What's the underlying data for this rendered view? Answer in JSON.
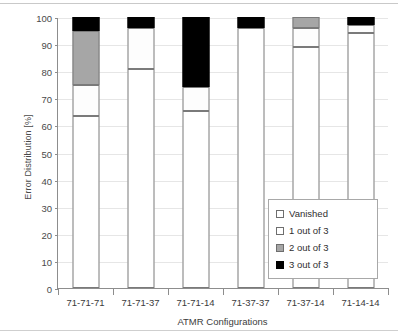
{
  "chart_data": {
    "type": "bar",
    "title": "",
    "subtitle": "",
    "xlabel": "ATMR Configurations",
    "ylabel": "Error Distribution [%]",
    "ylim": [
      0,
      100
    ],
    "yticks": [
      0,
      10,
      20,
      30,
      40,
      50,
      60,
      70,
      80,
      90,
      100
    ],
    "ytick_labels": [
      "0",
      "10",
      "20",
      "30",
      "40",
      "50",
      "60",
      "70",
      "80",
      "90",
      "100"
    ],
    "grid": true,
    "stacked": true,
    "legend_position": "inside-bottom-right",
    "categories": [
      "71-71-71",
      "71-71-37",
      "71-71-14",
      "71-37-37",
      "71-37-14",
      "71-14-14"
    ],
    "series": [
      {
        "name": "Vanished",
        "color": "#ffffff",
        "values": [
          63.5,
          81.0,
          65.5,
          96.0,
          89.0,
          94.0
        ]
      },
      {
        "name": "1 out of 3",
        "color": "#ffffff",
        "values": [
          11.5,
          15.0,
          8.5,
          0.0,
          7.0,
          3.0
        ]
      },
      {
        "name": "2 out of 3",
        "color": "#a6a6a6",
        "values": [
          20.0,
          0.0,
          0.0,
          0.0,
          4.0,
          0.0
        ]
      },
      {
        "name": "3 out of 3",
        "color": "#000000",
        "values": [
          5.0,
          4.0,
          26.0,
          4.0,
          0.0,
          3.0
        ]
      }
    ]
  },
  "legend": {
    "items": [
      {
        "label": "Vanished",
        "swatch": "vanished"
      },
      {
        "label": "1 out of 3",
        "swatch": "one"
      },
      {
        "label": "2 out of 3",
        "swatch": "two"
      },
      {
        "label": "3 out of 3",
        "swatch": "three"
      }
    ]
  },
  "colors": {
    "vanished": "#ffffff",
    "one_of_three": "#ffffff",
    "two_of_three": "#a6a6a6",
    "three_of_three": "#000000",
    "axis": "#8d8d8d",
    "grid": "#e6e6e6",
    "text": "#3b3b3b"
  }
}
